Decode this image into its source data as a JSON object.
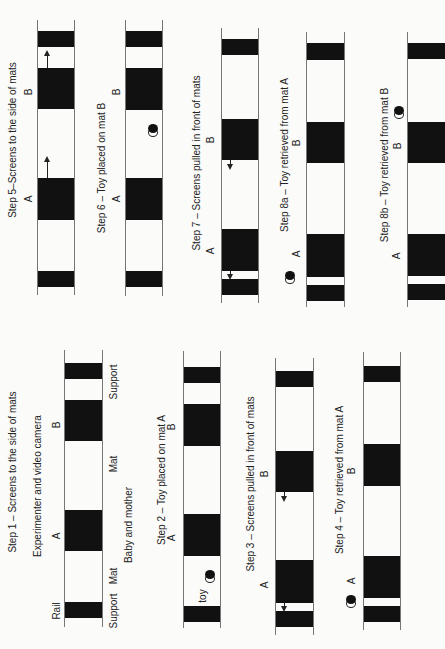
{
  "figure": {
    "panels": [
      {
        "id": "step1",
        "title": "Step 1 – Screens to the side of mats",
        "subtitle_top": "Experimenter and video camera",
        "subtitle_bottom": "Baby and mother",
        "labels": {
          "A": "A",
          "B": "B",
          "rail": "Rail",
          "mat_a": "Mat",
          "mat_b": "Mat",
          "support_top": "Support",
          "support_bottom": "Support"
        }
      },
      {
        "id": "step2",
        "title": "Step 2 – Toy placed on mat A",
        "labels": {
          "A": "A",
          "B": "B",
          "toy": "toy"
        }
      },
      {
        "id": "step3",
        "title": "Step 3 – Screens pulled in front of mats",
        "labels": {
          "A": "A",
          "B": "B"
        }
      },
      {
        "id": "step4",
        "title": "Step 4 – Toy retrieved from mat A",
        "labels": {
          "A": "A",
          "B": "B"
        }
      },
      {
        "id": "step5",
        "title": "Step 5–Screens to the side of mats",
        "labels": {
          "A": "A",
          "B": "B"
        }
      },
      {
        "id": "step6",
        "title": "Step 6 – Toy placed on mat B",
        "labels": {
          "A": "A",
          "B": "B"
        }
      },
      {
        "id": "step7",
        "title": "Step 7 – Screens pulled in front of mats",
        "labels": {
          "A": "A",
          "B": "B"
        }
      },
      {
        "id": "step8a",
        "title": "Step 8a – Toy retrieved from mat A",
        "labels": {
          "A": "A",
          "B": "B"
        }
      },
      {
        "id": "step8b",
        "title": "Step 8b – Toy retrieved from mat B",
        "labels": {
          "A": "A",
          "B": "B"
        }
      }
    ],
    "icons": {
      "toy": "toy-icon",
      "arrow_up": "arrow-up-icon",
      "arrow_down": "arrow-down-icon"
    },
    "colors": {
      "block": "#111111",
      "rail": "#777777",
      "background": "#fbfbfa"
    }
  }
}
